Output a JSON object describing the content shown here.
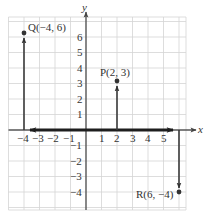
{
  "diagram": {
    "type": "coordinate-plane",
    "axes": {
      "x_label": "x",
      "y_label": "y",
      "x_ticks": [
        "−4",
        "−3",
        "−2",
        "−1",
        "1",
        "2",
        "3",
        "4",
        "5"
      ],
      "y_ticks_positive": [
        "1",
        "2",
        "3",
        "4",
        "5",
        "6"
      ],
      "y_ticks_negative": [
        "−1",
        "−2",
        "−3",
        "−4"
      ]
    },
    "points": [
      {
        "name": "Q",
        "label": "Q(−4, 6)",
        "x": -4,
        "y": 6
      },
      {
        "name": "P",
        "label": "P(2, 3)",
        "x": 2,
        "y": 3
      },
      {
        "name": "R",
        "label": "R(6, −4)",
        "x": 6,
        "y": -4
      }
    ],
    "arrows": [
      {
        "from": [
          -4,
          0
        ],
        "to": [
          -4,
          6
        ],
        "style": "thin"
      },
      {
        "from": [
          2,
          0
        ],
        "to": [
          2,
          3
        ],
        "style": "thin"
      },
      {
        "from": [
          6,
          0
        ],
        "to": [
          6,
          -4
        ],
        "style": "thin"
      },
      {
        "from": [
          6,
          0
        ],
        "to": [
          -4,
          0
        ],
        "style": "thick",
        "double_headed": true
      }
    ],
    "colors": {
      "grid": "#d4d4d4",
      "axis": "#555555",
      "vector": "#3a3a3a",
      "text": "#333333"
    }
  }
}
